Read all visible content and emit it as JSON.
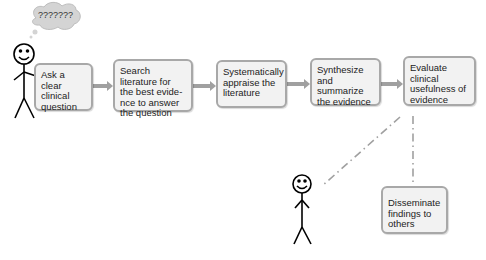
{
  "thought_bubble": {
    "text": "???????"
  },
  "steps": [
    {
      "id": "ask",
      "label": "Ask a clear clinical question"
    },
    {
      "id": "search",
      "label": "Search literature for the best evide-nce to answer the question"
    },
    {
      "id": "appraise",
      "label": "Systematically appraise the literature"
    },
    {
      "id": "synthesize",
      "label": "Synthesize and summarize the evidence"
    },
    {
      "id": "evaluate",
      "label": "Evaluate clinical usefulness of evidence"
    },
    {
      "id": "disseminate",
      "label": "Disseminate findings to others"
    }
  ],
  "colors": {
    "box_fill": "#f2f2f2",
    "box_border": "#a8a8a8",
    "arrow": "#a0a0a0",
    "bubble": "#d4d4d4"
  }
}
